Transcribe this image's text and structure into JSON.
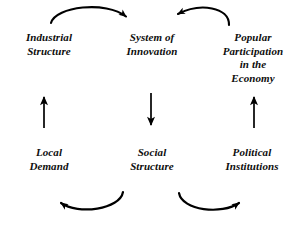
{
  "diagram": {
    "background_color": "#ffffff",
    "ink_color": "#000000",
    "nodes": [
      {
        "id": "industrial-structure",
        "label": "Industrial\nStructure",
        "column": "left",
        "row": "top"
      },
      {
        "id": "system-of-innovation",
        "label": "System of\nInnovation",
        "column": "center",
        "row": "top"
      },
      {
        "id": "popular-participation",
        "label": "Popular\nParticipation\nin the\nEconomy",
        "column": "right",
        "row": "top"
      },
      {
        "id": "local-demand",
        "label": "Local\nDemand",
        "column": "left",
        "row": "bottom"
      },
      {
        "id": "social-structure",
        "label": "Social\nStructure",
        "column": "center",
        "row": "bottom"
      },
      {
        "id": "political-institutions",
        "label": "Political\nInstitutions",
        "column": "right",
        "row": "bottom"
      }
    ],
    "arrows": [
      {
        "id": "industrial-structure-to-system-of-innovation",
        "from": "industrial-structure",
        "to": "system-of-innovation",
        "style": "curved",
        "direction": "right"
      },
      {
        "id": "popular-participation-to-system-of-innovation",
        "from": "popular-participation",
        "to": "system-of-innovation",
        "style": "curved",
        "direction": "left"
      },
      {
        "id": "local-demand-to-industrial-structure",
        "from": "local-demand",
        "to": "industrial-structure",
        "style": "straight",
        "direction": "up"
      },
      {
        "id": "system-of-innovation-to-social-structure",
        "from": "system-of-innovation",
        "to": "social-structure",
        "style": "straight",
        "direction": "down"
      },
      {
        "id": "political-institutions-to-popular-participation",
        "from": "political-institutions",
        "to": "popular-participation",
        "style": "straight",
        "direction": "up"
      },
      {
        "id": "social-structure-to-local-demand",
        "from": "social-structure",
        "to": "local-demand",
        "style": "curved",
        "direction": "left"
      },
      {
        "id": "social-structure-to-political-institutions",
        "from": "social-structure",
        "to": "political-institutions",
        "style": "curved",
        "direction": "right"
      }
    ],
    "caption": {
      "left_fragment": "",
      "right_fragment": ""
    }
  }
}
